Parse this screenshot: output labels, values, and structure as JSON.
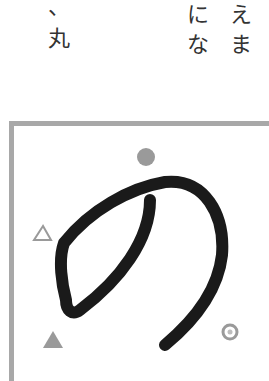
{
  "text_columns": {
    "left": [
      "、",
      "丸"
    ],
    "middle": [
      "に",
      "な"
    ],
    "right_partial": [
      "え",
      "ま"
    ]
  },
  "illustration": {
    "character": "の",
    "markers": [
      {
        "name": "filled-circle",
        "symbol": "●",
        "color": "#999999"
      },
      {
        "name": "outline-triangle",
        "symbol": "△",
        "color": "#999999"
      },
      {
        "name": "filled-triangle",
        "symbol": "▲",
        "color": "#999999"
      },
      {
        "name": "double-circle",
        "symbol": "◎",
        "color": "#999999"
      }
    ],
    "stroke_color": "#1a1a1a",
    "frame_color": "#a8a8a8"
  }
}
